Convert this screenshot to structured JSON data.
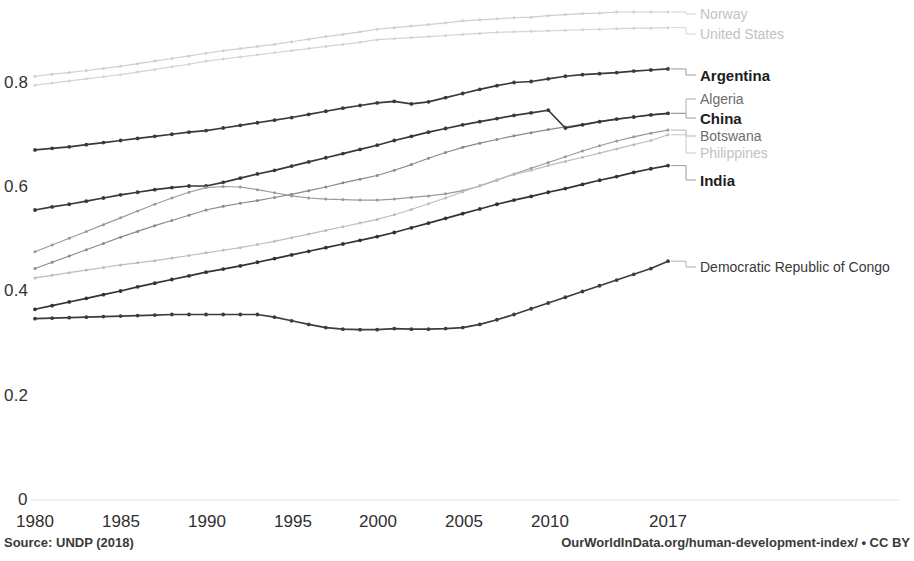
{
  "footer": {
    "source": "Source: UNDP (2018)",
    "attribution": "OurWorldInData.org/human-development-index/ • CC BY"
  },
  "axes": {
    "y_ticks": [
      "0.8",
      "0.6",
      "0.4",
      "0.2",
      "0"
    ],
    "x_ticks": [
      "1980",
      "1985",
      "1990",
      "1995",
      "2000",
      "2005",
      "2010",
      "2017"
    ]
  },
  "labels": {
    "norway": "Norway",
    "united_states": "United States",
    "argentina": "Argentina",
    "algeria": "Algeria",
    "china": "China",
    "botswana": "Botswana",
    "philippines": "Philippines",
    "india": "India",
    "drc": "Democratic Republic of Congo"
  },
  "chart_data": {
    "type": "line",
    "title": "",
    "subtitle": "",
    "xlabel": "",
    "ylabel": "",
    "xlim": [
      1980,
      2017
    ],
    "ylim": [
      0,
      0.95
    ],
    "y_ticks": [
      0,
      0.2,
      0.4,
      0.6,
      0.8
    ],
    "x_ticks": [
      1980,
      1985,
      1990,
      1995,
      2000,
      2005,
      2010,
      2017
    ],
    "grid": false,
    "legend_position": "right-inline-labels",
    "x": [
      1980,
      1981,
      1982,
      1983,
      1984,
      1985,
      1986,
      1987,
      1988,
      1989,
      1990,
      1991,
      1992,
      1993,
      1994,
      1995,
      1996,
      1997,
      1998,
      1999,
      2000,
      2001,
      2002,
      2003,
      2004,
      2005,
      2006,
      2007,
      2008,
      2009,
      2010,
      2011,
      2012,
      2013,
      2014,
      2015,
      2016,
      2017
    ],
    "series": [
      {
        "name": "Norway",
        "color": "#cfcfcf",
        "emphasis": "faint",
        "values": [
          0.811,
          0.815,
          0.818,
          0.822,
          0.826,
          0.83,
          0.835,
          0.84,
          0.845,
          0.85,
          0.855,
          0.86,
          0.864,
          0.868,
          0.872,
          0.877,
          0.882,
          0.887,
          0.891,
          0.896,
          0.901,
          0.904,
          0.907,
          0.91,
          0.913,
          0.917,
          0.919,
          0.921,
          0.923,
          0.924,
          0.927,
          0.929,
          0.931,
          0.932,
          0.934,
          0.934,
          0.934,
          0.934
        ]
      },
      {
        "name": "United States",
        "color": "#d4d4d4",
        "emphasis": "faint",
        "values": [
          0.794,
          0.798,
          0.802,
          0.806,
          0.81,
          0.814,
          0.819,
          0.824,
          0.829,
          0.834,
          0.84,
          0.844,
          0.848,
          0.852,
          0.856,
          0.86,
          0.864,
          0.868,
          0.872,
          0.876,
          0.881,
          0.883,
          0.885,
          0.887,
          0.889,
          0.891,
          0.893,
          0.895,
          0.896,
          0.897,
          0.898,
          0.899,
          0.9,
          0.901,
          0.902,
          0.903,
          0.903,
          0.904
        ]
      },
      {
        "name": "Argentina",
        "color": "#3a3a3a",
        "emphasis": "bold",
        "values": [
          0.67,
          0.673,
          0.676,
          0.68,
          0.684,
          0.688,
          0.692,
          0.696,
          0.7,
          0.704,
          0.707,
          0.712,
          0.717,
          0.722,
          0.727,
          0.732,
          0.738,
          0.744,
          0.75,
          0.755,
          0.76,
          0.763,
          0.758,
          0.762,
          0.77,
          0.778,
          0.786,
          0.793,
          0.799,
          0.801,
          0.806,
          0.811,
          0.814,
          0.816,
          0.818,
          0.821,
          0.823,
          0.825
        ]
      },
      {
        "name": "Algeria",
        "color": "#8a8a8a",
        "emphasis": "mid",
        "values": [
          0.443,
          0.455,
          0.467,
          0.479,
          0.491,
          0.503,
          0.514,
          0.525,
          0.535,
          0.545,
          0.555,
          0.562,
          0.568,
          0.573,
          0.579,
          0.585,
          0.592,
          0.599,
          0.607,
          0.614,
          0.621,
          0.631,
          0.642,
          0.654,
          0.665,
          0.675,
          0.683,
          0.69,
          0.697,
          0.703,
          0.709,
          0.714,
          0.719,
          0.724,
          0.729,
          0.733,
          0.737,
          0.74
        ]
      },
      {
        "name": "China",
        "color": "#383838",
        "emphasis": "bold",
        "values": [
          0.555,
          0.561,
          0.566,
          0.572,
          0.578,
          0.584,
          0.589,
          0.594,
          0.598,
          0.601,
          0.601,
          0.608,
          0.616,
          0.624,
          0.631,
          0.639,
          0.647,
          0.655,
          0.663,
          0.671,
          0.679,
          0.688,
          0.696,
          0.704,
          0.711,
          0.718,
          0.724,
          0.73,
          0.736,
          0.741,
          0.746,
          0.712,
          0.718,
          0.724,
          0.729,
          0.733,
          0.737,
          0.74
        ]
      },
      {
        "name": "Botswana",
        "color": "#9a9a9a",
        "emphasis": "mid",
        "values": [
          0.475,
          0.488,
          0.501,
          0.514,
          0.527,
          0.54,
          0.553,
          0.566,
          0.578,
          0.589,
          0.598,
          0.6,
          0.599,
          0.594,
          0.588,
          0.582,
          0.578,
          0.576,
          0.575,
          0.574,
          0.574,
          0.576,
          0.579,
          0.582,
          0.586,
          0.592,
          0.601,
          0.612,
          0.624,
          0.635,
          0.646,
          0.657,
          0.668,
          0.678,
          0.687,
          0.695,
          0.702,
          0.708
        ]
      },
      {
        "name": "Philippines",
        "color": "#bdbdbd",
        "emphasis": "faint",
        "values": [
          0.425,
          0.43,
          0.435,
          0.44,
          0.445,
          0.45,
          0.454,
          0.458,
          0.463,
          0.468,
          0.473,
          0.478,
          0.483,
          0.489,
          0.495,
          0.502,
          0.509,
          0.516,
          0.523,
          0.53,
          0.537,
          0.546,
          0.556,
          0.567,
          0.578,
          0.59,
          0.602,
          0.613,
          0.623,
          0.631,
          0.64,
          0.648,
          0.656,
          0.664,
          0.672,
          0.68,
          0.688,
          0.699
        ]
      },
      {
        "name": "India",
        "color": "#333333",
        "emphasis": "bold",
        "values": [
          0.365,
          0.372,
          0.379,
          0.386,
          0.393,
          0.4,
          0.408,
          0.415,
          0.422,
          0.429,
          0.436,
          0.442,
          0.448,
          0.455,
          0.462,
          0.469,
          0.476,
          0.483,
          0.49,
          0.497,
          0.504,
          0.512,
          0.521,
          0.53,
          0.539,
          0.548,
          0.557,
          0.566,
          0.574,
          0.581,
          0.589,
          0.596,
          0.604,
          0.612,
          0.619,
          0.627,
          0.634,
          0.64
        ]
      },
      {
        "name": "Democratic Republic of Congo",
        "color": "#3d3d3d",
        "emphasis": "bold",
        "values": [
          0.347,
          0.348,
          0.349,
          0.35,
          0.351,
          0.352,
          0.353,
          0.354,
          0.355,
          0.355,
          0.355,
          0.355,
          0.355,
          0.355,
          0.35,
          0.343,
          0.336,
          0.33,
          0.327,
          0.326,
          0.326,
          0.328,
          0.327,
          0.327,
          0.328,
          0.33,
          0.336,
          0.345,
          0.355,
          0.366,
          0.377,
          0.388,
          0.399,
          0.41,
          0.421,
          0.432,
          0.443,
          0.457
        ]
      }
    ]
  }
}
